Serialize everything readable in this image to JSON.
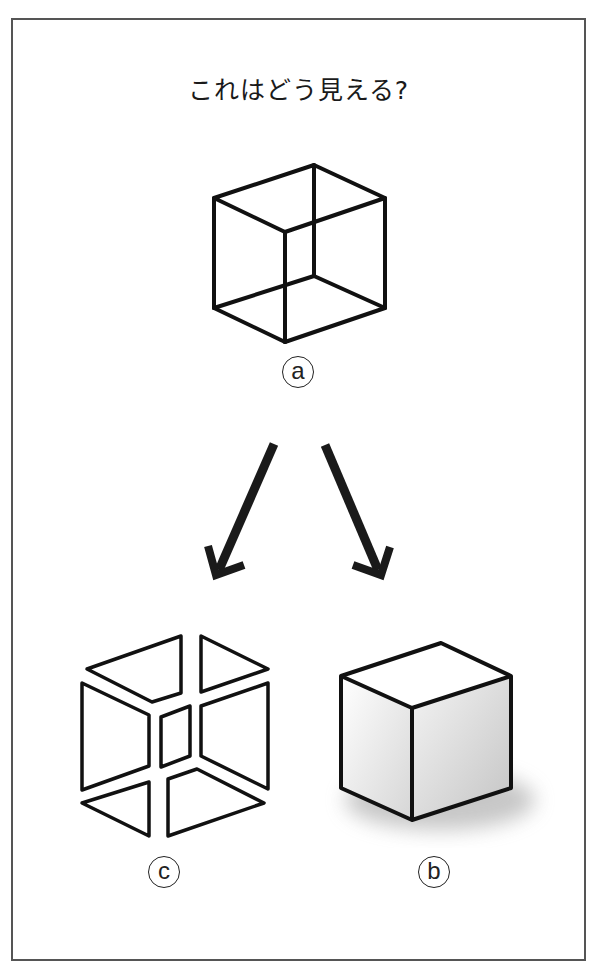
{
  "title": "これはどう見える?",
  "figures": {
    "a": {
      "label": "a",
      "description": "wireframe Necker cube"
    },
    "b": {
      "label": "b",
      "description": "solid shaded cube viewed from above"
    },
    "c": {
      "label": "c",
      "description": "cube interpreted as viewed from below / inside"
    }
  },
  "arrows": [
    {
      "from": "a",
      "to": "c",
      "direction": "down-left"
    },
    {
      "from": "a",
      "to": "b",
      "direction": "down-right"
    }
  ],
  "colors": {
    "stroke": "#111111",
    "frame": "#555555",
    "shade_light": "#ffffff",
    "shade_dark": "#c8c8c8"
  }
}
